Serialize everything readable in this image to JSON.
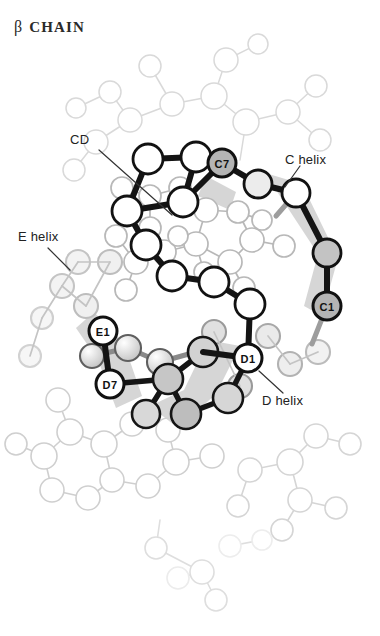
{
  "figure": {
    "title_greek": "β",
    "title_word": "CHAIN",
    "type": "protein-backbone-diagram",
    "background": "#ffffff"
  },
  "colors": {
    "foreground_outline": "#111111",
    "foreground_bond": "#141414",
    "midground_outline": "#6e6e6e",
    "background_outline": "#c9c9c9",
    "background_faint": "#e2e2e2",
    "atom_fill_white": "#ffffff",
    "atom_fill_gray": "#b4b4b4",
    "atom_fill_light": "#dcdcdc",
    "ribbon_shadow": "#cfcfcf",
    "label_text": "#222222"
  },
  "labels": [
    {
      "id": "cd",
      "text": "CD",
      "x": 78,
      "y": 141
    },
    {
      "id": "c-helix",
      "text": "C helix",
      "x": 312,
      "y": 160
    },
    {
      "id": "e-helix",
      "text": "E helix",
      "x": 42,
      "y": 238
    },
    {
      "id": "d-helix",
      "text": "D helix",
      "x": 290,
      "y": 402
    }
  ],
  "leaders": [
    {
      "id": "cd-leader",
      "x1": 98,
      "y1": 150,
      "x2": 170,
      "y2": 216
    },
    {
      "id": "c-helix-leader",
      "x1": 300,
      "y1": 166,
      "x2": 284,
      "y2": 186
    },
    {
      "id": "e-helix-leader",
      "x1": 48,
      "y1": 248,
      "x2": 68,
      "y2": 268
    },
    {
      "id": "d-helix-leader",
      "x1": 282,
      "y1": 394,
      "x2": 258,
      "y2": 372
    }
  ],
  "named_atoms": [
    {
      "id": "C7",
      "label": "C7",
      "x": 222,
      "y": 163,
      "r": 14,
      "fill": "#b4b4b4"
    },
    {
      "id": "C1",
      "label": "C1",
      "x": 327,
      "y": 306,
      "r": 14,
      "fill": "#b4b4b4"
    },
    {
      "id": "E1",
      "label": "E1",
      "x": 103,
      "y": 331,
      "r": 14,
      "fill": "#ffffff"
    },
    {
      "id": "D7",
      "label": "D7",
      "x": 110,
      "y": 384,
      "r": 14,
      "fill": "#ffffff"
    },
    {
      "id": "D1",
      "label": "D1",
      "x": 248,
      "y": 358,
      "r": 14,
      "fill": "#ffffff"
    }
  ],
  "chain_atoms": [
    {
      "id": "a1",
      "x": 148,
      "y": 159,
      "r": 15,
      "fill": "#ffffff"
    },
    {
      "id": "a2",
      "x": 196,
      "y": 157,
      "r": 15,
      "fill": "#ffffff"
    },
    {
      "id": "a3",
      "x": 183,
      "y": 202,
      "r": 15,
      "fill": "#ffffff"
    },
    {
      "id": "a4",
      "x": 127,
      "y": 211,
      "r": 15,
      "fill": "#ffffff"
    },
    {
      "id": "a5",
      "x": 146,
      "y": 245,
      "r": 15,
      "fill": "#ffffff"
    },
    {
      "id": "a6",
      "x": 172,
      "y": 276,
      "r": 15,
      "fill": "#ffffff"
    },
    {
      "id": "a7",
      "x": 214,
      "y": 282,
      "r": 15,
      "fill": "#ffffff"
    },
    {
      "id": "a8",
      "x": 250,
      "y": 304,
      "r": 15,
      "fill": "#ffffff"
    },
    {
      "id": "a9",
      "x": 258,
      "y": 184,
      "r": 14,
      "fill": "#ffffff"
    },
    {
      "id": "a10",
      "x": 296,
      "y": 193,
      "r": 14,
      "fill": "#ffffff"
    },
    {
      "id": "a11",
      "x": 327,
      "y": 253,
      "r": 14,
      "fill": "#c3c3c3"
    },
    {
      "id": "a12",
      "x": 203,
      "y": 352,
      "r": 15,
      "fill": "#d2d2d2"
    },
    {
      "id": "a13",
      "x": 168,
      "y": 379,
      "r": 15,
      "fill": "#c6c6c6"
    },
    {
      "id": "a14",
      "x": 186,
      "y": 414,
      "r": 15,
      "fill": "#bdbdbd"
    },
    {
      "id": "a15",
      "x": 228,
      "y": 398,
      "r": 15,
      "fill": "#d6d6d6"
    },
    {
      "id": "a16",
      "x": 146,
      "y": 414,
      "r": 14,
      "fill": "#d8d8d8"
    },
    {
      "id": "a17",
      "x": 104,
      "y": 295,
      "r": 14,
      "fill": "#eeeeee"
    }
  ],
  "chain_bonds": [
    [
      "a1",
      "a2"
    ],
    [
      "a2",
      "a3"
    ],
    [
      "a3",
      "a4"
    ],
    [
      "a4",
      "a5"
    ],
    [
      "a5",
      "a6"
    ],
    [
      "a6",
      "a7"
    ],
    [
      "a7",
      "a8"
    ],
    [
      "a1",
      "a4"
    ],
    [
      "a3",
      "C7"
    ],
    [
      "C7",
      "a9"
    ],
    [
      "a9",
      "a10"
    ],
    [
      "a10",
      "C1"
    ],
    [
      "C1",
      "a11"
    ],
    [
      "a8",
      "D1"
    ],
    [
      "D1",
      "a12"
    ],
    [
      "a12",
      "a13"
    ],
    [
      "a13",
      "a14"
    ],
    [
      "a14",
      "a15"
    ],
    [
      "a15",
      "D1"
    ],
    [
      "D7",
      "a13"
    ],
    [
      "E1",
      "D7"
    ],
    [
      "a13",
      "a16"
    ]
  ],
  "helix_ribbons": [
    {
      "id": "c-helix-ribbon",
      "points": "268,176 300,186 334,258 318,312 300,300 312,252 280,190"
    },
    {
      "id": "d-helix-ribbon",
      "points": "238,348 214,392 176,424 150,404 182,388 206,342"
    },
    {
      "id": "e-helix-ribbon",
      "points": "96,316 122,344 140,392 116,404 98,360 78,330"
    }
  ],
  "background_note": "faint gray side-chain and backbone atoms of the rest of the molecule"
}
